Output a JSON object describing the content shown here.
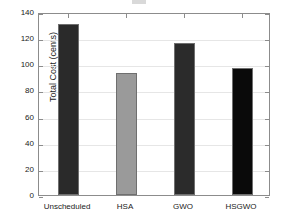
{
  "figure": {
    "background": "#ffffff",
    "axis_color": "#8c8c8c",
    "grid_color": "#e6e6e6",
    "text_color": "#1a1a1a"
  },
  "chart_data": {
    "type": "bar",
    "title": "",
    "xlabel": "",
    "ylabel": "Total Cost (cents)",
    "categories": [
      "Unscheduled",
      "HSA",
      "GWO",
      "HSGWO"
    ],
    "values": [
      131,
      93.5,
      116.5,
      97
    ],
    "bar_colors": [
      "#2a2a2a",
      "#9a9a9a",
      "#2b2b2b",
      "#0a0a0a"
    ],
    "ylim": [
      0,
      140
    ],
    "yticks": [
      0,
      20,
      40,
      60,
      80,
      100,
      120,
      140
    ],
    "ytick_labels": [
      "0",
      "20",
      "40",
      "60",
      "80",
      "100",
      "120",
      "140"
    ],
    "grid": true,
    "grid_axis": "y",
    "legend": null,
    "legend_position": "none"
  }
}
